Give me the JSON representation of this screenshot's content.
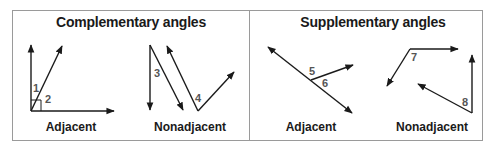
{
  "panels": [
    {
      "title": "Complementary angles",
      "examples": [
        {
          "label": "Adjacent",
          "angles": [
            "1",
            "2"
          ],
          "note": "right-angle mark at shared vertex"
        },
        {
          "label": "Nonadjacent",
          "angles": [
            "3",
            "4"
          ]
        }
      ]
    },
    {
      "title": "Supplementary angles",
      "examples": [
        {
          "label": "Adjacent",
          "angles": [
            "5",
            "6"
          ]
        },
        {
          "label": "Nonadjacent",
          "angles": [
            "7",
            "8"
          ]
        }
      ]
    }
  ],
  "colors": {
    "line": "#1a1a1a",
    "angle_number": "#555555",
    "border": "#9a9a9a",
    "background": "#ffffff"
  }
}
